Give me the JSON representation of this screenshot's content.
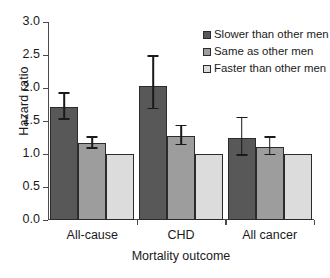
{
  "chart_data": {
    "type": "bar",
    "title": "",
    "xlabel": "Mortality outcome",
    "ylabel": "Hazard ratio",
    "ylim": [
      0.0,
      3.0
    ],
    "ytick_labels": [
      "0.0",
      "0.5",
      "1.0",
      "1.5",
      "2.0",
      "2.5",
      "3.0"
    ],
    "ytick_values": [
      0.0,
      0.5,
      1.0,
      1.5,
      2.0,
      2.5,
      3.0
    ],
    "grid": false,
    "legend_position": "top-right",
    "categories": [
      "All-cause",
      "CHD",
      "All cancer"
    ],
    "series": [
      {
        "name": "Slower than other men",
        "color": "#585858",
        "values": [
          1.71,
          2.03,
          1.25
        ],
        "errors_low": [
          1.52,
          1.68,
          0.97
        ],
        "errors_high": [
          1.91,
          2.47,
          1.54
        ]
      },
      {
        "name": "Same as other men",
        "color": "#9d9d9d",
        "values": [
          1.16,
          1.27,
          1.1
        ],
        "errors_low": [
          1.08,
          1.13,
          0.98
        ],
        "errors_high": [
          1.25,
          1.42,
          1.25
        ]
      },
      {
        "name": "Faster than other men",
        "color": "#dcdcdc",
        "values": [
          1.0,
          1.0,
          1.0
        ],
        "errors_low": [
          null,
          null,
          null
        ],
        "errors_high": [
          null,
          null,
          null
        ]
      }
    ]
  },
  "legend": {
    "items": [
      {
        "label": "Slower than other men",
        "color": "#585858"
      },
      {
        "label": "Same as other men",
        "color": "#9d9d9d"
      },
      {
        "label": "Faster than other men",
        "color": "#dcdcdc"
      }
    ]
  },
  "colors": {
    "axis": "#4a4a4a",
    "bar_outline": "#2b2b2b",
    "error_bar": "#1a1a1a",
    "text": "#1a1a1a",
    "background": "#ffffff"
  }
}
